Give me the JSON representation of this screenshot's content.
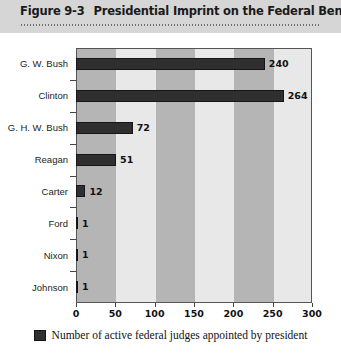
{
  "header": {
    "figure_number": "Figure 9-3",
    "title": "Presidential Imprint on the Federal Bench"
  },
  "legend": {
    "swatch_color": "#2f2f2f",
    "label": "Number of active federal judges appointed by president"
  },
  "colors": {
    "bar": "#2f2f2f",
    "band_dark": "#b5b5b5",
    "band_light": "#e8e8e8",
    "header_band": "#d6d6d6",
    "axis": "#555555"
  },
  "chart_data": {
    "type": "bar",
    "orientation": "horizontal",
    "title": "Presidential Imprint on the Federal Bench",
    "xlabel": "",
    "ylabel": "",
    "xlim": [
      0,
      300
    ],
    "xticks": [
      0,
      50,
      100,
      150,
      200,
      250,
      300
    ],
    "xtick_labels": [
      "0",
      "50",
      "100",
      "150",
      "200",
      "250",
      "300"
    ],
    "grid": false,
    "banded_background": true,
    "band_interval": 50,
    "legend_position": "bottom-center",
    "categories": [
      "G. W. Bush",
      "Clinton",
      "G. H. W. Bush",
      "Reagan",
      "Carter",
      "Ford",
      "Nixon",
      "Johnson"
    ],
    "values": [
      240,
      264,
      72,
      51,
      12,
      1,
      1,
      1
    ],
    "value_labels": [
      "240",
      "264",
      "72",
      "51",
      "12",
      "1",
      "1",
      "1"
    ],
    "series": [
      {
        "name": "Number of active federal judges appointed by president",
        "values": [
          240,
          264,
          72,
          51,
          12,
          1,
          1,
          1
        ]
      }
    ]
  }
}
